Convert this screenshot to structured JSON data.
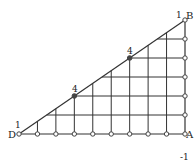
{
  "diagram": {
    "vertices": {
      "D": {
        "label": "D",
        "weight": "1"
      },
      "A": {
        "label": "A"
      },
      "B": {
        "label": "B",
        "weight": "1"
      }
    },
    "base_divisions": 9,
    "height_divisions": 6,
    "marked_points": [
      {
        "name": "mid-lower",
        "weight": "4",
        "col": 3,
        "row": 2
      },
      {
        "name": "mid-upper",
        "weight": "4",
        "col": 6,
        "row": 4
      }
    ],
    "corner_note": "-1",
    "line_color": "#333333",
    "node_color": "#444444"
  }
}
